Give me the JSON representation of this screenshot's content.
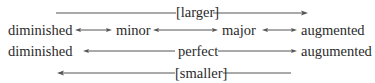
{
  "diagram": {
    "type": "interval-quality-relationship",
    "top_label": "[larger]",
    "bottom_label": "[smaller]",
    "rows": [
      {
        "name": "imperfect-intervals",
        "terms": [
          "diminished",
          "minor",
          "major",
          "augmented"
        ]
      },
      {
        "name": "perfect-intervals",
        "terms": [
          "diminished",
          "perfect",
          "augumented"
        ]
      }
    ],
    "edges": [
      {
        "from": "diminished",
        "to": "minor",
        "style": "double-arrow",
        "row": 0
      },
      {
        "from": "minor",
        "to": "major",
        "style": "double-arrow",
        "row": 0
      },
      {
        "from": "major",
        "to": "augmented",
        "style": "double-arrow",
        "row": 0
      },
      {
        "from": "perfect",
        "to": "diminished",
        "style": "single-arrow",
        "row": 1
      },
      {
        "from": "perfect",
        "to": "augumented",
        "style": "single-arrow",
        "row": 1
      }
    ],
    "direction_arrows": [
      {
        "label": "[larger]",
        "direction": "right"
      },
      {
        "label": "[smaller]",
        "direction": "left"
      }
    ]
  }
}
